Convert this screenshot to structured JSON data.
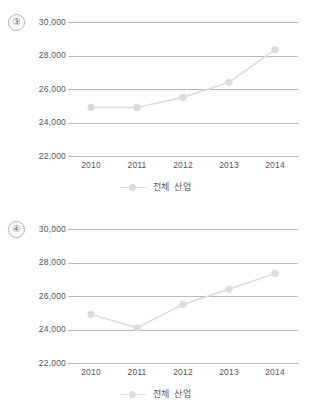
{
  "page": {
    "background_color": "#ffffff",
    "text_color": "#4d4d4d",
    "series_color": "#dcdcdc",
    "gridline_color": "#b8b8b8"
  },
  "charts": [
    {
      "item_number": "③",
      "legend_label": "전체 산업",
      "y_ticks": [
        "30,000",
        "28,000",
        "26,000",
        "24,000",
        "22,000"
      ],
      "x_ticks": [
        "2010",
        "2011",
        "2012",
        "2013",
        "2014"
      ],
      "chart_data": {
        "type": "line",
        "title": "",
        "xlabel": "",
        "ylabel": "",
        "categories": [
          "2010",
          "2011",
          "2012",
          "2013",
          "2014"
        ],
        "series": [
          {
            "name": "전체 산업",
            "values": [
              24900,
              24900,
              25500,
              26400,
              28350
            ]
          }
        ],
        "ylim": [
          22000,
          30000
        ],
        "ytick_values": [
          22000,
          24000,
          26000,
          28000,
          30000
        ],
        "grid": "horizontal",
        "legend_position": "bottom-center",
        "marker": "circle"
      }
    },
    {
      "item_number": "④",
      "legend_label": "전체 산업",
      "y_ticks": [
        "30,000",
        "28,000",
        "26,000",
        "24,000",
        "22,000"
      ],
      "x_ticks": [
        "2010",
        "2011",
        "2012",
        "2013",
        "2014"
      ],
      "chart_data": {
        "type": "line",
        "title": "",
        "xlabel": "",
        "ylabel": "",
        "categories": [
          "2010",
          "2011",
          "2012",
          "2013",
          "2014"
        ],
        "series": [
          {
            "name": "전체 산업",
            "values": [
              24900,
              24100,
              25500,
              26400,
              27350
            ]
          }
        ],
        "ylim": [
          22000,
          30000
        ],
        "ytick_values": [
          22000,
          24000,
          26000,
          28000,
          30000
        ],
        "grid": "horizontal",
        "legend_position": "bottom-center",
        "marker": "circle"
      }
    }
  ]
}
